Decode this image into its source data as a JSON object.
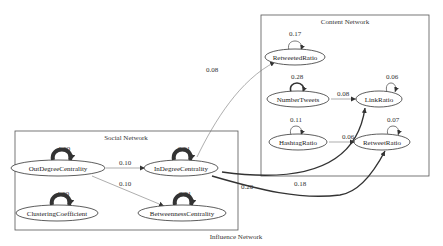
{
  "graph": {
    "title": "Influence Network",
    "clusters": [
      {
        "id": "content",
        "label": "Content Network"
      },
      {
        "id": "social",
        "label": "Social Network"
      }
    ],
    "nodes": [
      {
        "id": "RetweetedRatio",
        "label": "RetweetedRatio",
        "cluster": "content",
        "self_loop": "0.17"
      },
      {
        "id": "NumberTweets",
        "label": "NumberTweets",
        "cluster": "content",
        "self_loop": "0.28"
      },
      {
        "id": "LinkRatio",
        "label": "LinkRatio",
        "cluster": "content",
        "self_loop": "0.06"
      },
      {
        "id": "HashtagRatio",
        "label": "HashtagRatio",
        "cluster": "content",
        "self_loop": "0.11"
      },
      {
        "id": "RetweetRatio",
        "label": "RetweetRatio",
        "cluster": "content",
        "self_loop": "0.07"
      },
      {
        "id": "OutDegreeCentrality",
        "label": "OutDegreeCentrality",
        "cluster": "social",
        "self_loop": "1.00"
      },
      {
        "id": "InDegreeCentrality",
        "label": "InDegreeCentrality",
        "cluster": "social",
        "self_loop": "0.91"
      },
      {
        "id": "ClusteringCoefficient",
        "label": "ClusteringCoefficient",
        "cluster": "social",
        "self_loop": "1.00"
      },
      {
        "id": "BetweennessCentrality",
        "label": "BetweennessCentrality",
        "cluster": "social",
        "self_loop": "0.81"
      }
    ],
    "edges": [
      {
        "from": "NumberTweets",
        "to": "LinkRatio",
        "label": "0.08"
      },
      {
        "from": "HashtagRatio",
        "to": "RetweetRatio",
        "label": "0.06"
      },
      {
        "from": "OutDegreeCentrality",
        "to": "InDegreeCentrality",
        "label": "0.10"
      },
      {
        "from": "OutDegreeCentrality",
        "to": "BetweennessCentrality",
        "label": "0.10"
      },
      {
        "from": "InDegreeCentrality",
        "to": "RetweetedRatio",
        "label": "0.08"
      },
      {
        "from": "InDegreeCentrality",
        "to": "LinkRatio",
        "label": "0.20"
      },
      {
        "from": "InDegreeCentrality",
        "to": "RetweetRatio",
        "label": "0.18"
      }
    ]
  }
}
